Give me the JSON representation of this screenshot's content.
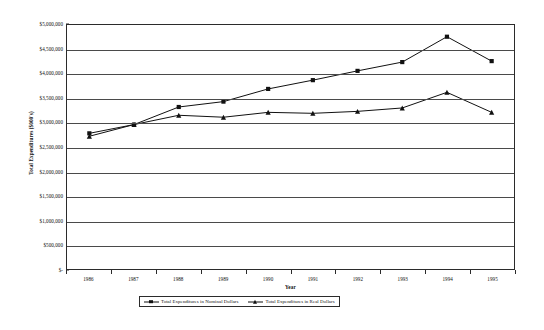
{
  "chart_data": {
    "type": "line",
    "title": "",
    "xlabel": "Year",
    "ylabel": "Total Expenditures ($000's)",
    "categories": [
      1986,
      1987,
      1988,
      1989,
      1990,
      1991,
      1992,
      1993,
      1994,
      1995
    ],
    "x_tick_labels": [
      "1986",
      "1987",
      "1988",
      "1989",
      "1990",
      "1991",
      "1992",
      "1993",
      "1994",
      "1995"
    ],
    "ylim": [
      0,
      5000000
    ],
    "y_ticks": [
      0,
      500000,
      1000000,
      1500000,
      2000000,
      2500000,
      3000000,
      3500000,
      4000000,
      4500000,
      5000000
    ],
    "y_tick_labels": [
      "$-",
      "$500,000",
      "$1,000,000",
      "$1,500,000",
      "$2,000,000",
      "$2,500,000",
      "$3,000,000",
      "$3,500,000",
      "$4,000,000",
      "$4,500,000",
      "$5,000,000"
    ],
    "grid": true,
    "legend_position": "bottom",
    "series": [
      {
        "name": "Total Expenditures in Nominal Dollars",
        "marker": "square",
        "color": "#111111",
        "values": [
          2780000,
          2960000,
          3320000,
          3430000,
          3690000,
          3870000,
          4060000,
          4240000,
          4760000,
          4260000
        ]
      },
      {
        "name": "Total Expenditures in Real Dollars",
        "marker": "triangle",
        "color": "#111111",
        "values": [
          2720000,
          2960000,
          3150000,
          3110000,
          3210000,
          3190000,
          3230000,
          3300000,
          3620000,
          3210000
        ]
      }
    ]
  }
}
